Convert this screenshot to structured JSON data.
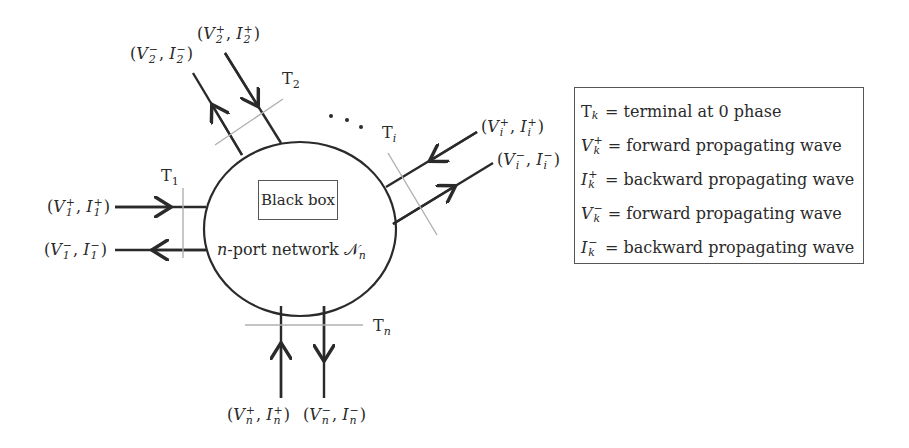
{
  "diagram": {
    "center": {
      "box_label": "Black box",
      "network_label_prefix": "n",
      "network_label_text": "-port network ",
      "network_symbol": "𝒩",
      "network_symbol_sub": "n"
    },
    "ports": [
      {
        "id": "1",
        "terminal": "T",
        "terminal_sub": "1",
        "incoming": {
          "V": "V",
          "I": "I",
          "sup": "+",
          "sub": "1"
        },
        "outgoing": {
          "V": "V",
          "I": "I",
          "sup": "−",
          "sub": "1"
        }
      },
      {
        "id": "2",
        "terminal": "T",
        "terminal_sub": "2",
        "incoming": {
          "V": "V",
          "I": "I",
          "sup": "+",
          "sub": "2"
        },
        "outgoing": {
          "V": "V",
          "I": "I",
          "sup": "−",
          "sub": "2"
        }
      },
      {
        "id": "i",
        "terminal": "T",
        "terminal_sub": "i",
        "incoming": {
          "V": "V",
          "I": "I",
          "sup": "+",
          "sub": "i"
        },
        "outgoing": {
          "V": "V",
          "I": "I",
          "sup": "−",
          "sub": "i"
        }
      },
      {
        "id": "n",
        "terminal": "T",
        "terminal_sub": "n",
        "incoming": {
          "V": "V",
          "I": "I",
          "sup": "+",
          "sub": "n"
        },
        "outgoing": {
          "V": "V",
          "I": "I",
          "sup": "−",
          "sub": "n"
        }
      }
    ],
    "ellipsis": ". . ."
  },
  "legend": {
    "rows": [
      {
        "sym": "T",
        "sup": "",
        "sub": "k",
        "desc": "= terminal at 0 phase"
      },
      {
        "sym": "V",
        "sup": "+",
        "sub": "k",
        "desc": "= forward propagating wave"
      },
      {
        "sym": "I",
        "sup": "+",
        "sub": "k",
        "desc": "= backward propagating wave"
      },
      {
        "sym": "V",
        "sup": "−",
        "sub": "k",
        "desc": "= forward propagating wave"
      },
      {
        "sym": "I",
        "sup": "−",
        "sub": "k",
        "desc": "= backward propagating wave"
      }
    ]
  },
  "colors": {
    "line": "#2a2a2a",
    "terminal_line": "#b0b0b0",
    "box_border": "#555555"
  }
}
